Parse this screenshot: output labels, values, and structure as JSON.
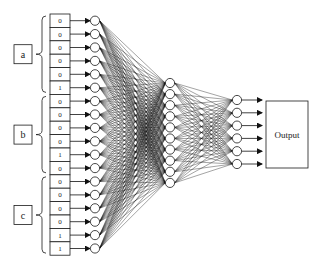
{
  "diagram": {
    "type": "neural-network",
    "colors": {
      "stroke": "#1a1a1a",
      "background": "#ffffff",
      "edge": "#111111"
    },
    "groups": [
      {
        "label": "a",
        "values": [
          "0",
          "0",
          "0",
          "0",
          "0",
          "1"
        ]
      },
      {
        "label": "b",
        "values": [
          "0",
          "0",
          "0",
          "0",
          "1",
          "0"
        ]
      },
      {
        "label": "c",
        "values": [
          "0",
          "0",
          "0",
          "0",
          "1",
          "1"
        ]
      }
    ],
    "layers": {
      "input_count": 18,
      "hidden_count": 10,
      "output_count": 6
    },
    "output_label": "Output"
  }
}
